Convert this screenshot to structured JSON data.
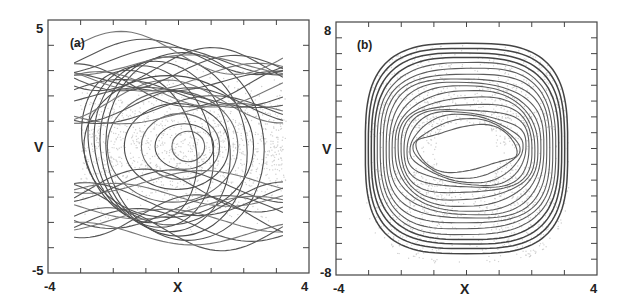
{
  "chart_data": [
    {
      "type": "line",
      "panel_label": "(a)",
      "xlabel": "X",
      "ylabel": "V",
      "xlim": [
        -4,
        4
      ],
      "ylim": [
        -5,
        5
      ],
      "x_tick_labels": [
        "-4",
        "4"
      ],
      "y_tick_labels": [
        "5",
        "-5"
      ],
      "x_minor_ticks": 8,
      "y_minor_ticks": 10,
      "grid": false,
      "description": "Phase-space trajectories: set of open streaming orbits across top and bottom bands plus nested closed orbits (trapped) centered near X≈0.3, V≈0; gray scatter background of particles.",
      "series": [
        {
          "name": "trapped-orbits",
          "center": [
            0.3,
            0.0
          ],
          "radii_x": [
            0.5,
            0.9,
            1.2,
            1.6,
            2.0,
            2.6
          ],
          "radii_y": [
            0.6,
            0.9,
            1.3,
            1.7,
            2.2,
            2.8
          ]
        },
        {
          "name": "passing-orbits-upper",
          "v_range": [
            1.2,
            3.8
          ]
        },
        {
          "name": "passing-orbits-lower",
          "v_range": [
            -3.6,
            -1.3
          ]
        }
      ]
    },
    {
      "type": "line",
      "panel_label": "(b)",
      "xlabel": "X",
      "ylabel": "V",
      "xlim": [
        -4,
        4
      ],
      "ylim": [
        -8,
        8
      ],
      "x_tick_labels": [
        "-4",
        "4"
      ],
      "y_tick_labels": [
        "8",
        "-8"
      ],
      "x_minor_ticks": 8,
      "y_minor_ticks": 16,
      "grid": false,
      "description": "Nested rounded-square closed orbits centered at X≈0, V≈0; outermost spans X≈-3.1..3.1, V≈-6.7..6.6; inner hole spans X≈-1.5..1.6, V≈-1.3..1.5; gray scatter background.",
      "series": [
        {
          "name": "closed-orbits",
          "center": [
            0.0,
            0.0
          ],
          "outer_extent": {
            "x": [
              -3.1,
              3.1
            ],
            "v": [
              -6.7,
              6.6
            ]
          },
          "inner_extent": {
            "x": [
              -1.5,
              1.6
            ],
            "v": [
              -1.3,
              1.5
            ]
          },
          "count": 18
        }
      ]
    }
  ],
  "panels": {
    "a": {
      "label": "(a)",
      "xlabel": "X",
      "ylabel": "V",
      "xmin": "-4",
      "xmax": "4",
      "ymax": "5",
      "ymin": "-5"
    },
    "b": {
      "label": "(b)",
      "xlabel": "X",
      "ylabel": "V",
      "xmin": "-4",
      "xmax": "4",
      "ymax": "8",
      "ymin": "-8"
    }
  },
  "colors": {
    "trajectory": "#555555",
    "scatter": "#cfcfcf",
    "frame": "#444444",
    "text": "#222222"
  }
}
